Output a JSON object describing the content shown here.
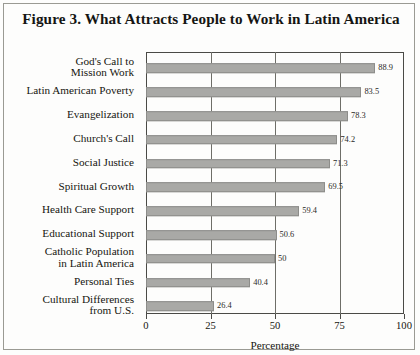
{
  "figure": {
    "title": "Figure 3.  What Attracts People to Work in Latin America"
  },
  "axis": {
    "x_title": "Percentage",
    "ticks": [
      "0",
      "25",
      "50",
      "75",
      "100"
    ]
  },
  "chart_data": {
    "type": "bar",
    "orientation": "horizontal",
    "title": "Figure 3.  What Attracts People to Work in Latin America",
    "xlabel": "Percentage",
    "ylabel": "",
    "xlim": [
      0,
      100
    ],
    "xticks": [
      0,
      25,
      50,
      75,
      100
    ],
    "grid": "vertical",
    "legend": "none",
    "bar_color": "#a9a9a6",
    "categories": [
      "God's Call to\nMission Work",
      "Latin American Poverty",
      "Evangelization",
      "Church's Call",
      "Social Justice",
      "Spiritual Growth",
      "Health Care Support",
      "Educational Support",
      "Catholic Population\nin Latin America",
      "Personal Ties",
      "Cultural Differences\nfrom U.S."
    ],
    "values": [
      88.9,
      83.5,
      78.3,
      74.2,
      71.3,
      69.5,
      59.4,
      50.6,
      50,
      40.4,
      26.4
    ],
    "value_labels": [
      "88.9",
      "83.5",
      "78.3",
      "74.2",
      "71.3",
      "69.5",
      "59.4",
      "50.6",
      "50",
      "40.4",
      "26.4"
    ]
  }
}
